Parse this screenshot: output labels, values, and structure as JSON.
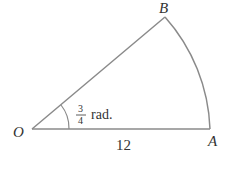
{
  "diagram": {
    "type": "circular-sector",
    "points": {
      "O": {
        "label": "O",
        "x": 32,
        "y": 129
      },
      "A": {
        "label": "A",
        "x": 210,
        "y": 129
      },
      "B": {
        "label": "B",
        "x": 165,
        "y": 17
      }
    },
    "radius_label": "12",
    "angle": {
      "numerator": "3",
      "denominator": "4",
      "unit": "rad."
    },
    "colors": {
      "stroke": "#8a8a8a",
      "text": "#333333"
    }
  }
}
